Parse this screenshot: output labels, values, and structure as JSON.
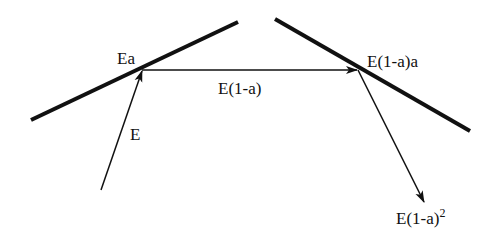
{
  "diagram": {
    "surfaces": [
      {
        "id": "surface-left",
        "x1": 31,
        "y1": 120,
        "x2": 238,
        "y2": 22
      },
      {
        "id": "surface-right",
        "x1": 275,
        "y1": 19,
        "x2": 470,
        "y2": 131
      }
    ],
    "arrows": [
      {
        "id": "incident",
        "x1": 101,
        "y1": 190,
        "x2": 142,
        "y2": 70
      },
      {
        "id": "reflected-1",
        "x1": 142,
        "y1": 70,
        "x2": 357,
        "y2": 70
      },
      {
        "id": "reflected-2",
        "x1": 358,
        "y1": 70,
        "x2": 424,
        "y2": 202
      }
    ],
    "labels": {
      "incident": "E",
      "absorbed_first": "Ea",
      "reflected_first": "E(1-a)",
      "absorbed_second": "E(1-a)a",
      "reflected_second_base": "E(1-a)",
      "reflected_second_exp": "2"
    },
    "colors": {
      "line": "#111111",
      "background": "#ffffff"
    }
  }
}
